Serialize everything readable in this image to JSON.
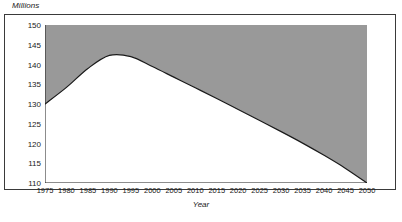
{
  "chart_data": {
    "type": "area",
    "title": "",
    "xlabel": "Year",
    "ylabel": "Millions",
    "xlim": [
      1975,
      2050
    ],
    "ylim": [
      110,
      150
    ],
    "grid": false,
    "legend": null,
    "fill_direction": "above-curve",
    "fill_color": "#999999",
    "line_color": "#1a1a1a",
    "x_ticks": [
      1975,
      1980,
      1985,
      1990,
      1995,
      2000,
      2005,
      2010,
      2015,
      2020,
      2025,
      2030,
      2035,
      2040,
      2045,
      2050
    ],
    "y_ticks": [
      110,
      115,
      120,
      125,
      130,
      135,
      140,
      145,
      150
    ],
    "x_tick_labels": [
      "1975",
      "1980",
      "1985",
      "1990",
      "1995",
      "2000",
      "2005",
      "2010",
      "2015",
      "2020",
      "2025",
      "2030",
      "2035",
      "2040",
      "2045",
      "2050"
    ],
    "y_tick_labels": [
      "110",
      "115",
      "120",
      "125",
      "130",
      "135",
      "140",
      "145",
      "150"
    ],
    "x": [
      1975,
      1980,
      1985,
      1990,
      1995,
      2000,
      2005,
      2010,
      2015,
      2020,
      2025,
      2030,
      2035,
      2040,
      2045,
      2050
    ],
    "values": [
      130.0,
      134.2,
      139.0,
      142.3,
      142.0,
      139.5,
      136.8,
      134.1,
      131.4,
      128.6,
      125.8,
      123.0,
      120.1,
      117.0,
      113.7,
      110.0
    ],
    "series": [
      {
        "name": "Population",
        "values": [
          130.0,
          134.2,
          139.0,
          142.3,
          142.0,
          139.5,
          136.8,
          134.1,
          131.4,
          128.6,
          125.8,
          123.0,
          120.1,
          117.0,
          113.7,
          110.0
        ]
      }
    ],
    "peak": {
      "x": 1991,
      "y": 142.5
    },
    "start": {
      "x": 1975,
      "y": 130.0
    },
    "end": {
      "x": 2050,
      "y": 110.0
    }
  }
}
